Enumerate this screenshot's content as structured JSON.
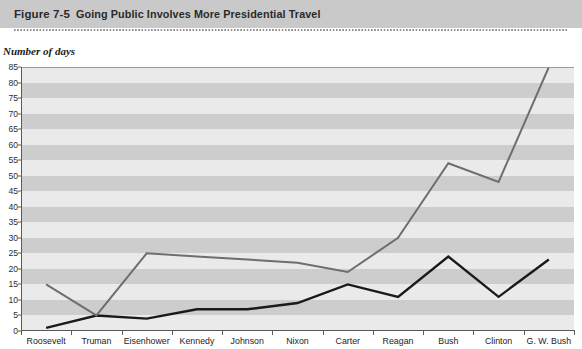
{
  "header": {
    "figure_number": "Figure 7-5",
    "title": "Going Public Involves More Presidential Travel"
  },
  "y_axis_caption": "Number of days",
  "chart_data": {
    "type": "line",
    "title": "Going Public Involves More Presidential Travel",
    "xlabel": "",
    "ylabel": "Number of days",
    "ylim": [
      0,
      85
    ],
    "ytick_step": 5,
    "yticks": [
      0,
      5,
      10,
      15,
      20,
      25,
      30,
      35,
      40,
      45,
      50,
      55,
      60,
      65,
      70,
      75,
      80,
      85
    ],
    "ytick_labels": [
      "0",
      "5",
      "10",
      "15",
      "20",
      "25",
      "30",
      "35",
      "40",
      "45",
      "50",
      "55",
      "60",
      "65",
      "70",
      "75",
      "80",
      "85"
    ],
    "grid": false,
    "banded_background": true,
    "band_colors": [
      "#eaeaea",
      "#cdcdcd"
    ],
    "legend": null,
    "legend_position": "none",
    "categories": [
      "Roosevelt",
      "Truman",
      "Eisenhower",
      "Kennedy",
      "Johnson",
      "Nixon",
      "Carter",
      "Reagan",
      "Bush",
      "Clinton",
      "G. W. Bush"
    ],
    "series": [
      {
        "name": "domestic-travel",
        "color": "#1a1a1a",
        "values": [
          1,
          5,
          4,
          7,
          7,
          9,
          15,
          11,
          24,
          11,
          23
        ]
      },
      {
        "name": "foreign-travel",
        "color": "#6e6e6e",
        "values": [
          15,
          5,
          25,
          24,
          23,
          22,
          19,
          30,
          54,
          48,
          85
        ]
      }
    ]
  }
}
